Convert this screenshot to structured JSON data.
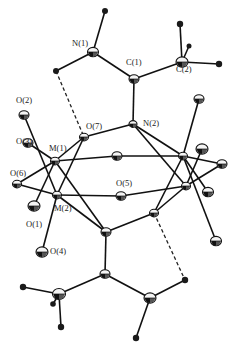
{
  "figure": {
    "type": "ORTEP molecular structure",
    "width": 235,
    "height": 348
  },
  "labels": [
    {
      "id": "N1",
      "text": "N(1)",
      "x": 72,
      "y": 46
    },
    {
      "id": "C1",
      "text": "C(1)",
      "x": 126,
      "y": 65
    },
    {
      "id": "C2",
      "text": "C(2)",
      "x": 176,
      "y": 72
    },
    {
      "id": "O2",
      "text": "O(2)",
      "x": 16,
      "y": 103
    },
    {
      "id": "O7",
      "text": "O(7)",
      "x": 86,
      "y": 129
    },
    {
      "id": "N2",
      "text": "N(2)",
      "x": 143,
      "y": 126
    },
    {
      "id": "O3",
      "text": "O(3)",
      "x": 16,
      "y": 144
    },
    {
      "id": "M1",
      "text": "M(1)",
      "x": 49,
      "y": 151
    },
    {
      "id": "O6",
      "text": "O(6)",
      "x": 10,
      "y": 176
    },
    {
      "id": "O5",
      "text": "O(5)",
      "x": 116,
      "y": 186
    },
    {
      "id": "O1",
      "text": "O(1)",
      "x": 26,
      "y": 227
    },
    {
      "id": "M2",
      "text": "M(2)",
      "x": 54,
      "y": 211
    },
    {
      "id": "O4",
      "text": "O(4)",
      "x": 50,
      "y": 254
    }
  ],
  "atoms": [
    {
      "id": "N1",
      "x": 93,
      "y": 52,
      "r": 5.5,
      "kind": "ring"
    },
    {
      "id": "C1",
      "x": 134,
      "y": 79,
      "r": 5,
      "kind": "ring"
    },
    {
      "id": "C2",
      "x": 182,
      "y": 62,
      "r": 6,
      "kind": "ring"
    },
    {
      "id": "H1a",
      "x": 105,
      "y": 11,
      "r": 3,
      "kind": "h"
    },
    {
      "id": "H1b",
      "x": 56,
      "y": 71,
      "r": 3,
      "kind": "h"
    },
    {
      "id": "H2a",
      "x": 180,
      "y": 24,
      "r": 3.2,
      "kind": "h"
    },
    {
      "id": "H2b",
      "x": 219,
      "y": 64,
      "r": 3.2,
      "kind": "h"
    },
    {
      "id": "H2c",
      "x": 189,
      "y": 46,
      "r": 2.5,
      "kind": "h"
    },
    {
      "id": "N2",
      "x": 133,
      "y": 124,
      "r": 4,
      "kind": "ring"
    },
    {
      "id": "O2",
      "x": 24,
      "y": 115,
      "r": 5,
      "kind": "ring"
    },
    {
      "id": "O7",
      "x": 84,
      "y": 137,
      "r": 4.5,
      "kind": "ring"
    },
    {
      "id": "Otr",
      "x": 199,
      "y": 99,
      "r": 5,
      "kind": "ring"
    },
    {
      "id": "M1",
      "x": 55,
      "y": 161,
      "r": 4.5,
      "kind": "ring"
    },
    {
      "id": "O3",
      "x": 28,
      "y": 143,
      "r": 5,
      "kind": "ring"
    },
    {
      "id": "O6",
      "x": 17,
      "y": 184,
      "r": 4.5,
      "kind": "ring"
    },
    {
      "id": "O1",
      "x": 34,
      "y": 206,
      "r": 6,
      "kind": "ring"
    },
    {
      "id": "M2",
      "x": 57,
      "y": 195,
      "r": 4.5,
      "kind": "ring"
    },
    {
      "id": "Ob",
      "x": 117,
      "y": 156,
      "r": 5,
      "kind": "ring"
    },
    {
      "id": "O5",
      "x": 121,
      "y": 196,
      "r": 5,
      "kind": "ring"
    },
    {
      "id": "M3",
      "x": 183,
      "y": 156,
      "r": 4.5,
      "kind": "ring"
    },
    {
      "id": "M4",
      "x": 186,
      "y": 186,
      "r": 4.5,
      "kind": "ring"
    },
    {
      "id": "Or1",
      "x": 202,
      "y": 149,
      "r": 6,
      "kind": "ring"
    },
    {
      "id": "Or2",
      "x": 222,
      "y": 164,
      "r": 5,
      "kind": "ring"
    },
    {
      "id": "Or3",
      "x": 208,
      "y": 192,
      "r": 5.5,
      "kind": "ring"
    },
    {
      "id": "Or4",
      "x": 216,
      "y": 241,
      "r": 5.5,
      "kind": "ring"
    },
    {
      "id": "Nb",
      "x": 154,
      "y": 213,
      "r": 4.5,
      "kind": "ring"
    },
    {
      "id": "Ob2",
      "x": 106,
      "y": 232,
      "r": 5,
      "kind": "ring"
    },
    {
      "id": "O4",
      "x": 42,
      "y": 252,
      "r": 6,
      "kind": "ring"
    },
    {
      "id": "Cb1",
      "x": 105,
      "y": 274,
      "r": 5,
      "kind": "ring"
    },
    {
      "id": "Cb2",
      "x": 59,
      "y": 294,
      "r": 6.5,
      "kind": "ring"
    },
    {
      "id": "Cb3",
      "x": 150,
      "y": 298,
      "r": 6,
      "kind": "ring"
    },
    {
      "id": "Hb1",
      "x": 23,
      "y": 287,
      "r": 3.2,
      "kind": "h"
    },
    {
      "id": "Hb2",
      "x": 61,
      "y": 327,
      "r": 3.2,
      "kind": "h"
    },
    {
      "id": "Hb3",
      "x": 53,
      "y": 304,
      "r": 2.8,
      "kind": "h"
    },
    {
      "id": "Hb4",
      "x": 185,
      "y": 280,
      "r": 3.2,
      "kind": "h"
    },
    {
      "id": "Hb5",
      "x": 136,
      "y": 338,
      "r": 3.2,
      "kind": "h"
    }
  ],
  "bonds": [
    [
      "N1",
      "H1a"
    ],
    [
      "N1",
      "H1b"
    ],
    [
      "N1",
      "C1"
    ],
    [
      "C1",
      "C2"
    ],
    [
      "C2",
      "H2a"
    ],
    [
      "C2",
      "H2b"
    ],
    [
      "C2",
      "H2c"
    ],
    [
      "C1",
      "N2"
    ],
    [
      "N2",
      "O7"
    ],
    [
      "N2",
      "M3"
    ],
    [
      "N2",
      "M4"
    ],
    [
      "O2",
      "M2"
    ],
    [
      "O7",
      "M1"
    ],
    [
      "O7",
      "M2"
    ],
    [
      "M1",
      "O3"
    ],
    [
      "M1",
      "O6"
    ],
    [
      "M1",
      "Ob"
    ],
    [
      "M1",
      "Ob2"
    ],
    [
      "M1",
      "O1"
    ],
    [
      "M2",
      "O6"
    ],
    [
      "M2",
      "O5"
    ],
    [
      "M2",
      "O4"
    ],
    [
      "M2",
      "Ob2"
    ],
    [
      "Ob",
      "M3"
    ],
    [
      "O5",
      "M4"
    ],
    [
      "M3",
      "Otr"
    ],
    [
      "M3",
      "Or2"
    ],
    [
      "M3",
      "Or3"
    ],
    [
      "M3",
      "Nb"
    ],
    [
      "M3",
      "Or4"
    ],
    [
      "M4",
      "Or1"
    ],
    [
      "M4",
      "Or2"
    ],
    [
      "M4",
      "Nb"
    ],
    [
      "Nb",
      "Ob2"
    ],
    [
      "Ob2",
      "Cb1"
    ],
    [
      "Cb1",
      "Cb2"
    ],
    [
      "Cb1",
      "Cb3"
    ],
    [
      "Cb2",
      "Hb1"
    ],
    [
      "Cb2",
      "Hb2"
    ],
    [
      "Cb2",
      "Hb3"
    ],
    [
      "Cb3",
      "Hb4"
    ],
    [
      "Cb3",
      "Hb5"
    ]
  ],
  "hbonds": [
    [
      "H1b",
      "O7"
    ],
    [
      "Nb",
      "Hb4"
    ]
  ]
}
